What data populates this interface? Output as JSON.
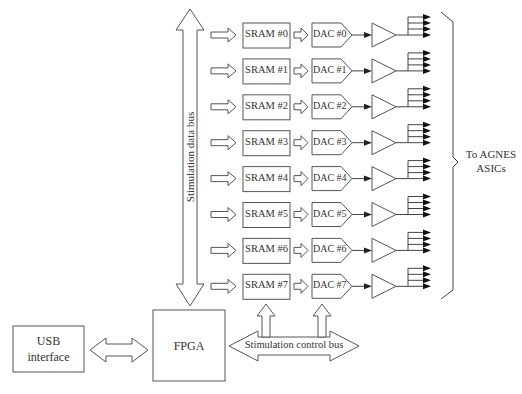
{
  "diagram": {
    "data_bus": {
      "label": "Stimulation data bus"
    },
    "control_bus": {
      "label": "Stimulation control bus"
    },
    "usb": {
      "label_line1": "USB",
      "label_line2": "interface"
    },
    "fpga": {
      "label": "FPGA"
    },
    "output": {
      "label_line1": "To AGNES",
      "label_line2": "ASICs"
    },
    "channels": [
      {
        "sram": "SRAM #0",
        "dac": "DAC #0"
      },
      {
        "sram": "SRAM #1",
        "dac": "DAC #1"
      },
      {
        "sram": "SRAM #2",
        "dac": "DAC #2"
      },
      {
        "sram": "SRAM #3",
        "dac": "DAC #3"
      },
      {
        "sram": "SRAM #4",
        "dac": "DAC #4"
      },
      {
        "sram": "SRAM #5",
        "dac": "DAC #5"
      },
      {
        "sram": "SRAM #6",
        "dac": "DAC #6"
      },
      {
        "sram": "SRAM #7",
        "dac": "DAC #7"
      }
    ],
    "outputs_per_channel": 4,
    "colors": {
      "stroke": "#555555",
      "fill": "#ffffff",
      "text": "#333333"
    }
  }
}
